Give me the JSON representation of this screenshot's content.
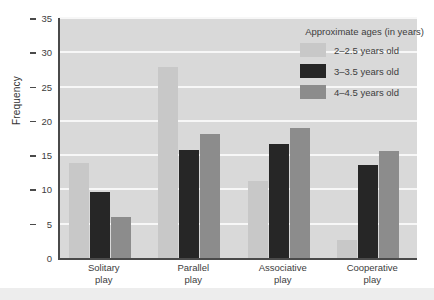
{
  "chart_data": {
    "type": "bar",
    "title": "",
    "xlabel": "",
    "ylabel": "Frequency",
    "ylim": [
      0,
      35
    ],
    "yticks": [
      0,
      5,
      10,
      15,
      20,
      25,
      30,
      35
    ],
    "grid": true,
    "legend_position": "top-right",
    "legend_title": "Approximate ages (in years)",
    "categories": [
      "Solitary play",
      "Parallel play",
      "Associative play",
      "Cooperative play"
    ],
    "category_lines": [
      [
        "Solitary",
        "play"
      ],
      [
        "Parallel",
        "play"
      ],
      [
        "Associative",
        "play"
      ],
      [
        "Cooperative",
        "play"
      ]
    ],
    "series": [
      {
        "name": "2–2.5 years old",
        "color": "#c8c8c8",
        "values": [
          13.8,
          27.8,
          11.2,
          2.7
        ]
      },
      {
        "name": "3–3.5 years old",
        "color": "#262626",
        "values": [
          9.6,
          15.8,
          16.6,
          13.5
        ]
      },
      {
        "name": "4–4.5 years old",
        "color": "#8c8c8c",
        "values": [
          6.0,
          18.1,
          18.9,
          15.6
        ]
      }
    ],
    "plot_background": "#d9d9d9",
    "gridline_color": "#f7f7f7",
    "axis_color": "#4a4a4a"
  }
}
